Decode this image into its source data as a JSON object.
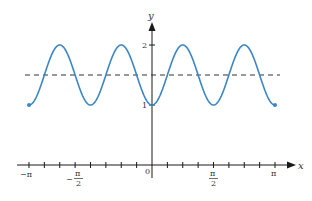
{
  "chart_data": {
    "type": "line",
    "title": "",
    "xlabel": "x",
    "ylabel": "y",
    "function": "y = 1.5 - 0.5 cos(4x)",
    "domain": [
      "-π",
      "π"
    ],
    "xlim": [
      -3.1416,
      3.1416
    ],
    "ylim": [
      0,
      2
    ],
    "grid": false,
    "legend": null,
    "x_tick_labels": [
      "−π",
      "−π/2",
      "0",
      "π/2",
      "π"
    ],
    "x_tick_positions": [
      -3.1416,
      -1.5708,
      0,
      1.5708,
      3.1416
    ],
    "x_minor_tick_step": 0.3927,
    "y_tick_labels": [
      "1",
      "2"
    ],
    "y_tick_positions": [
      1,
      2
    ],
    "series": [
      {
        "name": "curve",
        "color": "#3b86c6",
        "style": "solid",
        "endpoints_marked": true,
        "x": [
          -3.1416,
          -2.3562,
          -1.5708,
          -0.7854,
          0,
          0.7854,
          1.5708,
          2.3562,
          3.1416
        ],
        "y": [
          1,
          2,
          1,
          2,
          1,
          2,
          1,
          2,
          1
        ]
      },
      {
        "name": "midline",
        "color": "#333333",
        "style": "dashed",
        "x": [
          -3.1416,
          3.1416
        ],
        "y": [
          1.5,
          1.5
        ]
      }
    ]
  },
  "labels": {
    "x_axis": "x",
    "y_axis": "y",
    "y_tick_1": "1",
    "y_tick_2": "2",
    "x_neg_pi": "−π",
    "x_neg_half_pi_num": "π",
    "x_neg_half_pi_sign": "−",
    "x_half_den": "2",
    "x_zero": "0",
    "x_half_pi_num": "π",
    "x_pi": "π"
  }
}
